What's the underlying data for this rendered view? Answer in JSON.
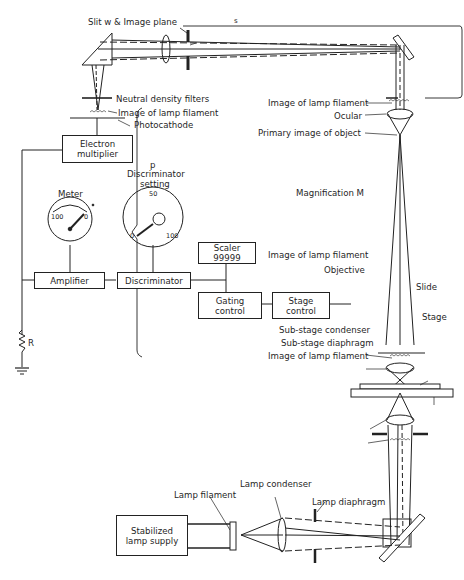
{
  "figure": {
    "labels": {
      "slit": "Slit w & Image plane",
      "s_marker": "s",
      "neutral_density": "Neutral density filters",
      "image_lamp_filament_top": "Image of lamp filament",
      "photocathode": "Photocathode",
      "image_lamp_filament_ocular": "Image of lamp filament",
      "ocular": "Ocular",
      "primary_image": "Primary image of object",
      "magnification": "Magnification M",
      "image_lamp_filament_objective": "Image of lamp filament",
      "objective": "Objective",
      "slide": "Slide",
      "stage": "Stage",
      "substage_condenser": "Sub-stage condenser",
      "substage_diaphragm": "Sub-stage diaphragm",
      "image_lamp_filament_substage": "Image of lamp filament",
      "lamp_filament": "Lamp filament",
      "lamp_condenser": "Lamp condenser",
      "lamp_diaphragm": "Lamp diaphragm",
      "resistor": "R"
    },
    "boxes": {
      "electron_multiplier": [
        "Electron",
        "multiplier"
      ],
      "amplifier": "Amplifier",
      "discriminator": "Discriminator",
      "scaler": [
        "Scaler",
        "99999"
      ],
      "gating_control": [
        "Gating",
        "control"
      ],
      "stage_control": [
        "Stage",
        "control"
      ],
      "lamp_supply": [
        "Stabilized",
        "lamp supply"
      ]
    },
    "meter": {
      "title": "Meter",
      "scale_left": "100",
      "scale_right": "0"
    },
    "discriminator_dial": {
      "symbol": "p",
      "title_line1": "Discriminator",
      "title_line2": "setting",
      "scale_top": "50",
      "scale_left": "0",
      "scale_right": "100"
    },
    "colors": {
      "ink": "#1f1f1f",
      "background": "#ffffff"
    }
  }
}
